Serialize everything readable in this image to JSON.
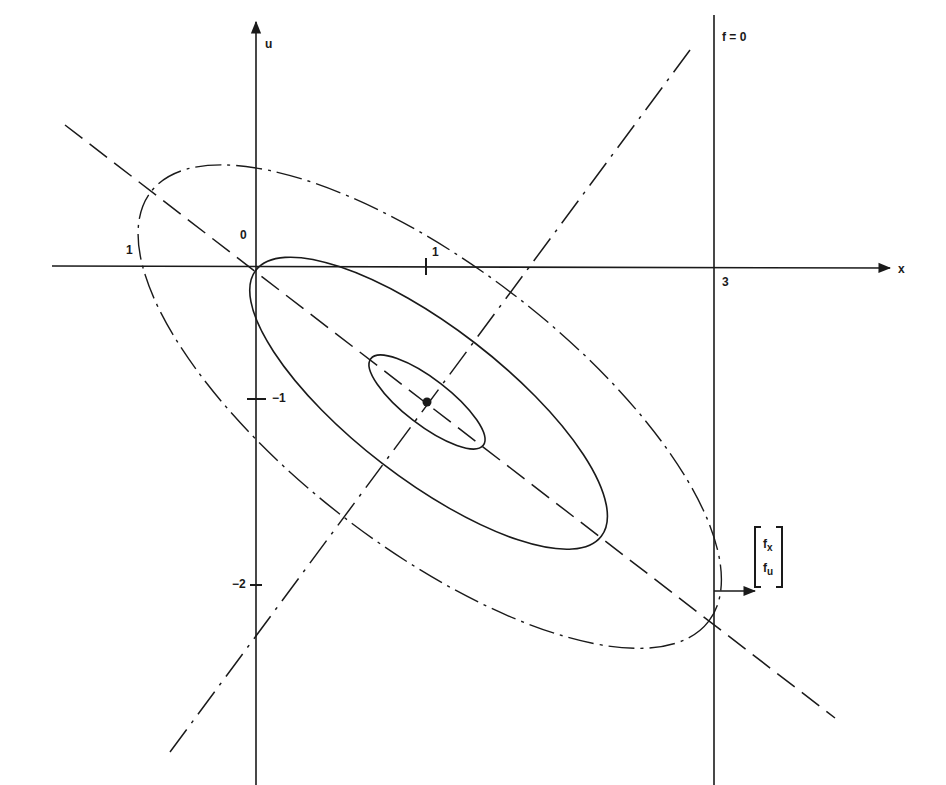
{
  "figure": {
    "axes": {
      "x_label": "x",
      "u_label": "u",
      "origin_label": "0",
      "x_ticks": [
        {
          "value": -1,
          "label": "1"
        },
        {
          "value": 1,
          "label": "1"
        },
        {
          "value": 3,
          "label": "3"
        }
      ],
      "u_ticks": [
        {
          "value": -1,
          "label": "−1"
        },
        {
          "value": -2,
          "label": "−2"
        }
      ]
    },
    "constraint_line": {
      "label": "f = 0",
      "x": 3
    },
    "gradient_vector": {
      "top": "f",
      "top_sub": "x",
      "bottom": "f",
      "bottom_sub": "u"
    },
    "contours": [
      {
        "name": "inner",
        "style": "solid"
      },
      {
        "name": "middle",
        "style": "solid"
      },
      {
        "name": "outer",
        "style": "dash-dot"
      }
    ],
    "principal_axes": [
      {
        "name": "major",
        "style": "dashed"
      },
      {
        "name": "minor",
        "style": "dash-dot"
      }
    ],
    "center_point": {
      "marker": "dot"
    }
  },
  "colors": {
    "ink": "#1a1a1a",
    "background": "#ffffff"
  }
}
